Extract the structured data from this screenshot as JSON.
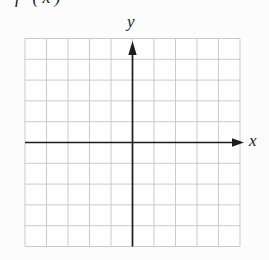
{
  "page": {
    "background": "#fcfcfc",
    "partial_heading": "f (x)"
  },
  "figure": {
    "x_axis_label": "x",
    "y_axis_label": "y",
    "colors": {
      "grid": "#cbcbcb",
      "axis": "#1c1c1c",
      "label": "#1c1c1c",
      "plot_background": "#fefefe"
    }
  },
  "chart_data": {
    "type": "line",
    "title": "",
    "xlabel": "x",
    "ylabel": "y",
    "series": [],
    "xlim": [
      -5,
      5
    ],
    "ylim": [
      -5,
      5
    ],
    "grid": true,
    "grid_cols": 10,
    "grid_rows": 10,
    "axes_through_origin": true,
    "arrowheads": [
      "+x",
      "+y"
    ],
    "tick_labels": "none"
  }
}
